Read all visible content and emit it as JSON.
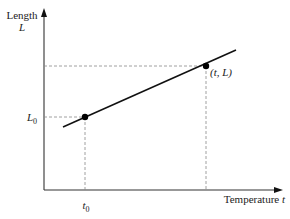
{
  "diagram": {
    "type": "line-graph",
    "y_axis": {
      "label_line1": "Length",
      "label_line2": "L"
    },
    "x_axis": {
      "label": "Temperature",
      "label_var": "t"
    },
    "points": [
      {
        "name": "initial",
        "x_label": "t",
        "x_sub": "0",
        "y_label": "L",
        "y_sub": "0"
      },
      {
        "name": "final",
        "label": "(t, L)"
      }
    ],
    "colors": {
      "line": "#111111",
      "axis": "#333333",
      "dashed": "#888888",
      "point": "#000000"
    }
  }
}
